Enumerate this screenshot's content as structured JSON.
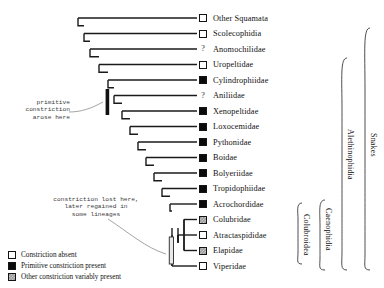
{
  "taxa": [
    {
      "name": "Other Squamata",
      "state": "absent",
      "symbol": "box"
    },
    {
      "name": "Scolecophidia",
      "state": "absent",
      "symbol": "box"
    },
    {
      "name": "Anomochilidae",
      "state": "unknown",
      "symbol": "?"
    },
    {
      "name": "Uropeltidae",
      "state": "absent",
      "symbol": "box"
    },
    {
      "name": "Cylindrophiidae",
      "state": "primitive",
      "symbol": "box"
    },
    {
      "name": "Aniliidae",
      "state": "unknown",
      "symbol": "?"
    },
    {
      "name": "Xenopeltidae",
      "state": "primitive",
      "symbol": "box"
    },
    {
      "name": "Loxocemidae",
      "state": "primitive",
      "symbol": "box"
    },
    {
      "name": "Pythonidae",
      "state": "primitive",
      "symbol": "box"
    },
    {
      "name": "Boidae",
      "state": "primitive",
      "symbol": "box"
    },
    {
      "name": "Bolyeriidae",
      "state": "primitive",
      "symbol": "box"
    },
    {
      "name": "Tropidophiidae",
      "state": "primitive",
      "symbol": "box"
    },
    {
      "name": "Acrochordidae",
      "state": "primitive",
      "symbol": "box"
    },
    {
      "name": "Colubridae",
      "state": "variable",
      "symbol": "box"
    },
    {
      "name": "Atractaspididae",
      "state": "absent",
      "symbol": "box"
    },
    {
      "name": "Elapidae",
      "state": "variable",
      "symbol": "box"
    },
    {
      "name": "Viperidae",
      "state": "absent",
      "symbol": "box"
    }
  ],
  "annotations": [
    {
      "id": "primitive-gain",
      "lines": [
        "primitive",
        "constriction",
        "arose here"
      ]
    },
    {
      "id": "constriction-loss",
      "lines": [
        "constriction lost here,",
        "later regained in",
        "some lineages"
      ]
    }
  ],
  "clades": [
    {
      "id": "snakes",
      "label": "Snakes"
    },
    {
      "id": "alethinophidia",
      "label": "Alethinophidia"
    },
    {
      "id": "caenophidia",
      "label": "Caenophidia"
    },
    {
      "id": "colubroidea",
      "label": "Colubroidea"
    }
  ],
  "legend": [
    {
      "state": "absent",
      "label": "Constriction absent"
    },
    {
      "state": "primitive",
      "label": "Primitive constriction present"
    },
    {
      "state": "variable",
      "label": "Other constriction variably present"
    }
  ],
  "colors": {
    "line": "#1a1a1a",
    "text": "#111111",
    "primitive_fill": "#0a0a0a",
    "variable_fill": "#9a9a9a",
    "absent_fill": "#ffffff",
    "annotation_text": "#3b3b3b"
  }
}
